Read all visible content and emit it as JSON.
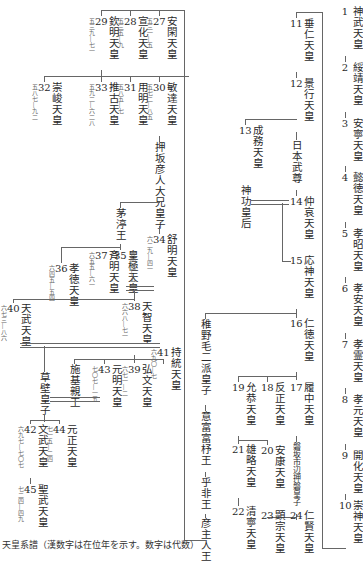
{
  "nodes": {
    "n1": {
      "name": "神武天皇",
      "num": "1"
    },
    "n2": {
      "name": "綏靖天皇",
      "num": "2"
    },
    "n3": {
      "name": "安寧天皇",
      "num": "3"
    },
    "n4": {
      "name": "懿徳天皇",
      "num": "4"
    },
    "n5": {
      "name": "孝昭天皇",
      "num": "5"
    },
    "n6": {
      "name": "孝安天皇",
      "num": "6"
    },
    "n7": {
      "name": "孝霊天皇",
      "num": "7"
    },
    "n8": {
      "name": "孝元天皇",
      "num": "8"
    },
    "n9": {
      "name": "開化天皇",
      "num": "9"
    },
    "n10": {
      "name": "崇神天皇",
      "num": "10"
    },
    "n11": {
      "name": "垂仁天皇",
      "num": "11"
    },
    "n12": {
      "name": "景行天皇",
      "num": "12"
    },
    "n13": {
      "name": "成務天皇",
      "num": "13"
    },
    "n14": {
      "name": "仲哀天皇",
      "num": "14"
    },
    "n15": {
      "name": "応神天皇",
      "num": "15"
    },
    "n16": {
      "name": "仁徳天皇",
      "num": "16"
    },
    "n17": {
      "name": "履中天皇",
      "num": "17"
    },
    "n18": {
      "name": "反正天皇",
      "num": "18"
    },
    "n19": {
      "name": "允恭天皇",
      "num": "19"
    },
    "n20": {
      "name": "安康天皇",
      "num": "20"
    },
    "n21": {
      "name": "雄略天皇",
      "num": "21"
    },
    "n22": {
      "name": "清寧天皇",
      "num": "22"
    },
    "n23": {
      "name": "顕宗天皇",
      "num": "23"
    },
    "n24": {
      "name": "仁賢天皇",
      "num": "24"
    },
    "n25": {
      "name": "武烈天皇",
      "num": "25"
    },
    "n26": {
      "name": "継体天皇",
      "num": "26"
    },
    "n27": {
      "name": "安閑天皇",
      "num": "27",
      "years": "五三一―五"
    },
    "n28": {
      "name": "宣化天皇",
      "num": "28",
      "years": "五三五―九"
    },
    "n29": {
      "name": "欽明天皇",
      "num": "29",
      "years": "五三九―七一"
    },
    "n30": {
      "name": "敏達天皇",
      "num": "30",
      "years": "五七二―八五"
    },
    "n31": {
      "name": "用明天皇",
      "num": "31",
      "years": "五八五―七"
    },
    "n32": {
      "name": "崇峻天皇",
      "num": "32",
      "years": "五八七―九二"
    },
    "n33": {
      "name": "推古天皇",
      "num": "33",
      "years": "五九二―六二八"
    },
    "n34": {
      "name": "舒明天皇",
      "num": "34",
      "years": "六二九―四一"
    },
    "n35": {
      "name": "皇極天皇",
      "num": "35",
      "years": "六四二―五"
    },
    "n36": {
      "name": "孝徳天皇",
      "num": "36",
      "years": "六四五―五四"
    },
    "n37": {
      "name": "斉明天皇",
      "num": "37",
      "years": "六五五―六一"
    },
    "n38": {
      "name": "天智天皇",
      "num": "38",
      "years": "六六八―七一"
    },
    "n39": {
      "name": "弘文天皇",
      "num": "39",
      "years": "六七一―二"
    },
    "n40": {
      "name": "天武天皇",
      "num": "40",
      "years": "六七三―八六"
    },
    "n41": {
      "name": "持統天皇",
      "num": "41",
      "years": "六九〇―七"
    },
    "n42": {
      "name": "文武天皇",
      "num": "42",
      "years": "六九七―七〇七"
    },
    "n43": {
      "name": "元明天皇",
      "num": "43",
      "years": "七〇七―一五"
    },
    "n44": {
      "name": "元正天皇",
      "num": "44",
      "years": "七一五―二四"
    },
    "n45": {
      "name": "聖武天皇",
      "num": "45",
      "years": "七二四―四九"
    },
    "yamato": {
      "name": "日本武尊"
    },
    "jingu": {
      "name": "神功皇后"
    },
    "wakanuke": {
      "name": "稚野毛二派皇子"
    },
    "ohoho": {
      "name": "意富富杼王"
    },
    "ohi": {
      "name": "乎非王"
    },
    "hikoushi": {
      "name": "彦主人王"
    },
    "ichinobe": {
      "name": "磐坂市辺押磐皇子"
    },
    "oshisaka": {
      "name": "押坂彦人大兄皇子"
    },
    "chinu": {
      "name": "茅渟王"
    },
    "kusakabe": {
      "name": "草壁皇子"
    },
    "shiki": {
      "name": "施基親王"
    }
  },
  "caption": "天皇系譜（漢数字は在位年を示す。数字は代数）"
}
